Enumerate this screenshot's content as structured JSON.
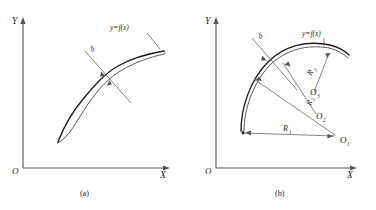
{
  "figure": {
    "domain_kind": "technical-line-diagram",
    "background_color": "#ffffff",
    "ink_color": "#1a1a1a",
    "axis_color": "#555555",
    "panels": [
      {
        "id": "a",
        "panel_label": "(a)",
        "axis_y_label": "Y",
        "axis_x_label": "X",
        "origin_label": "O",
        "function_label": "y=f(x)",
        "thickness_label": "δ",
        "description": "S-shaped double curve with constant offset thickness"
      },
      {
        "id": "b",
        "panel_label": "(b)",
        "axis_y_label": "Y",
        "axis_x_label": "X",
        "origin_label": "O",
        "function_label": "y=f(x)",
        "thickness_label": "δ",
        "radii": [
          {
            "label": "R",
            "sub": "1"
          },
          {
            "label": "R",
            "sub": "2"
          },
          {
            "label": "R",
            "sub": "3"
          }
        ],
        "centers": [
          {
            "label": "O",
            "sub": "1"
          },
          {
            "label": "O",
            "sub": "2"
          },
          {
            "label": "O",
            "sub": "3"
          }
        ],
        "description": "Arc approximated by three circular segments with radii R1 R2 R3 from centers O1 O2 O3"
      }
    ],
    "caption": ""
  }
}
